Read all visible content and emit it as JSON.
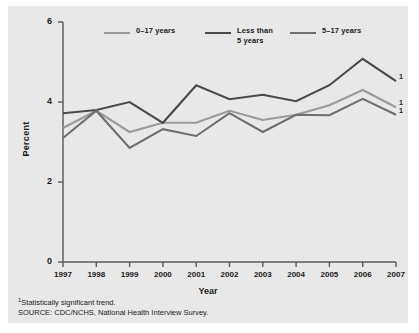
{
  "chart_data": {
    "type": "line",
    "title": "",
    "xlabel": "Year",
    "ylabel": "Percent",
    "categories": [
      "1997",
      "1998",
      "1999",
      "2000",
      "2001",
      "2002",
      "2003",
      "2004",
      "2005",
      "2006",
      "2007"
    ],
    "x": [
      1997,
      1998,
      1999,
      2000,
      2001,
      2002,
      2003,
      2004,
      2005,
      2006,
      2007
    ],
    "xlim": [
      1997,
      2007
    ],
    "ylim": [
      0,
      6
    ],
    "yticks": [
      0,
      2,
      4,
      6
    ],
    "ytick_labels": [
      "0",
      "2",
      "4",
      "6"
    ],
    "grid": false,
    "legend_position": "top",
    "series": [
      {
        "name": "0–17 years",
        "color": "#9a9a9a",
        "values": [
          3.35,
          3.78,
          3.25,
          3.48,
          3.48,
          3.78,
          3.55,
          3.68,
          3.92,
          4.3,
          3.87
        ],
        "end_marker": "1"
      },
      {
        "name": "Less than\n5 years",
        "legend_label_oneline": "Less than 5 years",
        "color": "#4a4a4a",
        "values": [
          3.72,
          3.8,
          4.0,
          3.48,
          4.42,
          4.07,
          4.18,
          4.02,
          4.42,
          5.08,
          4.52
        ],
        "end_marker": "1"
      },
      {
        "name": "5–17 years",
        "color": "#6e6e6e",
        "values": [
          3.1,
          3.78,
          2.85,
          3.32,
          3.15,
          3.72,
          3.25,
          3.68,
          3.67,
          4.08,
          3.68
        ],
        "end_marker": "1"
      }
    ]
  },
  "axes": {
    "ylabel": "Percent",
    "xlabel": "Year"
  },
  "footnotes": {
    "marker": "1",
    "significance": "Statistically significant trend.",
    "source": "SOURCE: CDC/NCHS, National Health Interview Survey."
  },
  "colors": {
    "panel_background": "#e8e8e8",
    "page_background": "#ffffff",
    "axis": "#5a5a5a",
    "text": "#1a1a1a"
  }
}
